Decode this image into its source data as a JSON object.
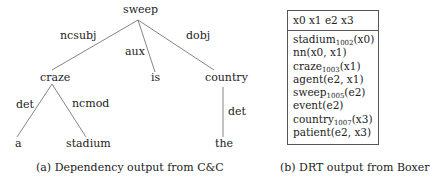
{
  "panel_a": {
    "nodes": {
      "sweep": "sweep",
      "craze": "craze",
      "is": "is",
      "country": "country",
      "a": "a",
      "stadium": "stadium",
      "the": "the"
    },
    "edges": {
      "ncsubj": "ncsubj",
      "aux": "aux",
      "dobj": "dobj",
      "det_craze": "det",
      "ncmod": "ncmod",
      "det_country": "det"
    },
    "caption": "(a) Dependency output from C&C"
  },
  "panel_b": {
    "header": "x0 x1 e2 x3",
    "conditions": [
      {
        "pred": "stadium",
        "sub": "1002",
        "args": "(x0)"
      },
      {
        "pred": "nn",
        "sub": "",
        "args": "(x0, x1)"
      },
      {
        "pred": "craze",
        "sub": "1003",
        "args": "(x1)"
      },
      {
        "pred": "agent",
        "sub": "",
        "args": "(e2, x1)"
      },
      {
        "pred": "sweep",
        "sub": "1005",
        "args": "(e2)"
      },
      {
        "pred": "event",
        "sub": "",
        "args": "(e2)"
      },
      {
        "pred": "country",
        "sub": "1007",
        "args": "(x3)"
      },
      {
        "pred": "patient",
        "sub": "",
        "args": "(e2, x3)"
      }
    ],
    "caption": "(b) DRT output from Boxer"
  }
}
